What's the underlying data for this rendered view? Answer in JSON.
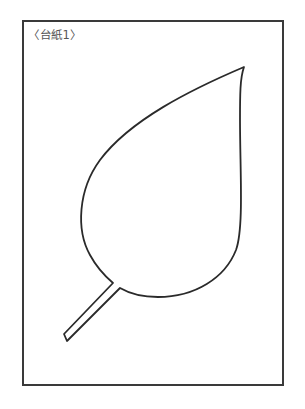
{
  "sheet": {
    "label": "〈台紙1〉",
    "border_color": "#3a3a3a"
  },
  "figure": {
    "shape": "leaf-outline",
    "stroke_color": "#2a2a2a"
  }
}
